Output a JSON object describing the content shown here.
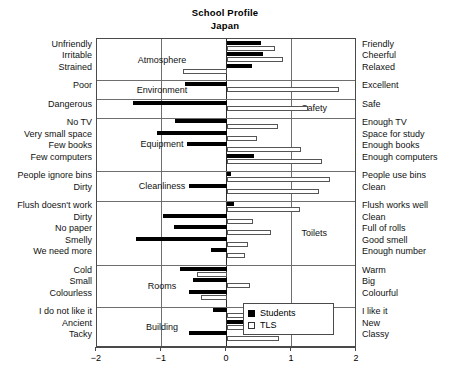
{
  "title": {
    "main": "School Profile",
    "sub": "Japan"
  },
  "legend": {
    "position": "bottom-right",
    "entries": [
      {
        "key": "students",
        "label": "Students",
        "color": "#000000",
        "style": "filled"
      },
      {
        "key": "tls",
        "label": "TLS",
        "color": "#ffffff",
        "style": "outlined"
      }
    ]
  },
  "axis": {
    "ticks": [
      "−2",
      "−1",
      "0",
      "1",
      "2"
    ],
    "min": -2,
    "max": 2,
    "gridlines": [
      -1,
      1
    ],
    "zero": 0
  },
  "chart_data": {
    "type": "bar",
    "orientation": "horizontal-diverging",
    "title": "School Profile",
    "subtitle": "Japan",
    "xlabel": "",
    "ylabel": "",
    "xlim": [
      -2,
      2
    ],
    "grid": true,
    "legend_position": "bottom-right",
    "series_names": [
      "Students",
      "TLS"
    ],
    "groups": [
      {
        "name": "Atmosphere",
        "items": [
          {
            "left_label": "Unfriendly",
            "right_label": "Friendly",
            "students": 0.52,
            "tls": 0.74
          },
          {
            "left_label": "Irritable",
            "right_label": "Cheerful",
            "students": 0.55,
            "tls": 0.86
          },
          {
            "left_label": "Strained",
            "right_label": "Relaxed",
            "students": 0.38,
            "tls": -0.68
          }
        ]
      },
      {
        "name": "Environment",
        "items": [
          {
            "left_label": "Poor",
            "right_label": "Excellent",
            "students": -0.64,
            "tls": 1.72
          }
        ]
      },
      {
        "name": "Safety",
        "items": [
          {
            "left_label": "Dangerous",
            "right_label": "Safe",
            "students": -1.44,
            "tls": 1.24
          }
        ]
      },
      {
        "name": "Equipment",
        "items": [
          {
            "left_label": "No TV",
            "right_label": "Enough TV",
            "students": -0.8,
            "tls": 0.78
          },
          {
            "left_label": "Very small space",
            "right_label": "Space for study",
            "students": -1.08,
            "tls": 0.46
          },
          {
            "left_label": "Few books",
            "right_label": "Enough books",
            "students": -0.62,
            "tls": 1.14
          },
          {
            "left_label": "Few computers",
            "right_label": "Enough computers",
            "students": 0.42,
            "tls": 1.46
          }
        ]
      },
      {
        "name": "Cleanliness",
        "items": [
          {
            "left_label": "People ignore bins",
            "right_label": "People use bins",
            "students": 0.06,
            "tls": 1.58
          },
          {
            "left_label": "Dirty",
            "right_label": "Clean",
            "students": -0.58,
            "tls": 1.42
          }
        ]
      },
      {
        "name": "Toilets",
        "items": [
          {
            "left_label": "Flush doesn't work",
            "right_label": "Flush works well",
            "students": 0.1,
            "tls": 1.12
          },
          {
            "left_label": "Dirty",
            "right_label": "Clean",
            "students": -0.98,
            "tls": 0.4
          },
          {
            "left_label": "No paper",
            "right_label": "Full of rolls",
            "students": -0.82,
            "tls": 0.68
          },
          {
            "left_label": "Smelly",
            "right_label": "Good smell",
            "students": -1.4,
            "tls": 0.33
          },
          {
            "left_label": "We need more",
            "right_label": "Enough number",
            "students": -0.24,
            "tls": 0.27
          }
        ]
      },
      {
        "name": "Rooms",
        "items": [
          {
            "left_label": "Cold",
            "right_label": "Warm",
            "students": -0.72,
            "tls": -0.46
          },
          {
            "left_label": "Small",
            "right_label": "Big",
            "students": -0.52,
            "tls": 0.36
          },
          {
            "left_label": "Colourless",
            "right_label": "Colourful",
            "students": -0.58,
            "tls": -0.4
          }
        ]
      },
      {
        "name": "Building",
        "items": [
          {
            "left_label": "I do not like it",
            "right_label": "I like it",
            "students": -0.22,
            "tls": 0.88
          },
          {
            "left_label": "Ancient",
            "right_label": "New",
            "students": 0.6,
            "tls": 1.28
          },
          {
            "left_label": "Tacky",
            "right_label": "Classy",
            "students": -0.58,
            "tls": 0.8
          }
        ]
      }
    ]
  }
}
